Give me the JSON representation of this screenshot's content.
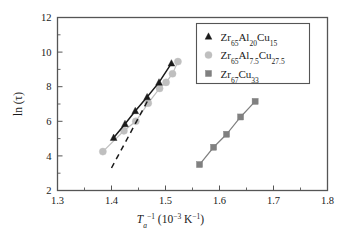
{
  "chart_data": {
    "type": "scatter",
    "title": "",
    "subtitle": "",
    "xlabel": "T_a^-1 (10^-3 K^-1)",
    "ylabel": "ln (τ)",
    "xlim": [
      1.3,
      1.8
    ],
    "ylim": [
      2,
      12
    ],
    "xticks": [
      "1.3",
      "1.4",
      "1.5",
      "1.6",
      "1.7",
      "1.8"
    ],
    "xtick_values": [
      1.3,
      1.4,
      1.5,
      1.6,
      1.7,
      1.8
    ],
    "yticks": [
      "2",
      "4",
      "6",
      "8",
      "10",
      "12"
    ],
    "ytick_values": [
      2,
      4,
      6,
      8,
      10,
      12
    ],
    "minor_xticks": [
      1.35,
      1.45,
      1.55,
      1.65,
      1.75
    ],
    "minor_yticks": [
      3,
      5,
      7,
      9,
      11
    ],
    "grid": false,
    "legend_position": "top-right",
    "series": [
      {
        "name": "Zr65Al20Cu15",
        "marker": "triangle",
        "color": "#1a1a1a",
        "line": "solid",
        "x": [
          1.404,
          1.425,
          1.444,
          1.466,
          1.488,
          1.511
        ],
        "y": [
          5.05,
          5.85,
          6.6,
          7.4,
          8.25,
          9.35
        ]
      },
      {
        "name": "Zr65Al7.5Cu27.5",
        "marker": "circle",
        "color": "#bfbfbf",
        "line": "solid",
        "x": [
          1.384,
          1.423,
          1.445,
          1.468,
          1.489,
          1.501,
          1.513,
          1.523
        ],
        "y": [
          4.25,
          5.45,
          6.0,
          7.05,
          7.9,
          8.25,
          8.75,
          9.45
        ]
      },
      {
        "name": "Zr67Cu33",
        "marker": "square",
        "color": "#808080",
        "line": "solid",
        "x": [
          1.563,
          1.589,
          1.613,
          1.639,
          1.666
        ],
        "y": [
          3.5,
          4.5,
          5.25,
          6.25,
          7.15
        ]
      }
    ],
    "annotations": [
      {
        "type": "dashed-line",
        "x": [
          1.4,
          1.468
        ],
        "y": [
          3.3,
          7.25
        ],
        "color": "#1a1a1a"
      }
    ]
  },
  "legend": {
    "items": [
      {
        "label_html": "Zr<sub>65</sub>Al<sub>20</sub>Cu<sub>15</sub>",
        "marker": "triangle",
        "color": "#1a1a1a"
      },
      {
        "label_html": "Zr<sub>65</sub>Al<sub>7.5</sub>Cu<sub>27.5</sub>",
        "marker": "circle",
        "color": "#bfbfbf"
      },
      {
        "label_html": "Zr<sub>67</sub>Cu<sub>33</sub>",
        "marker": "square",
        "color": "#808080"
      }
    ]
  },
  "axes": {
    "y_label_html": "ln (&tau;)",
    "x_label_html": "<i>T</i><sub>a</sub><sup>&minus;1</sup> (10<sup>&minus;3</sup>&thinsp;K<sup>&minus;1</sup>)"
  },
  "style": {
    "frame_color": "#555555",
    "background": "#ffffff",
    "text_color": "#1a1a1a"
  }
}
